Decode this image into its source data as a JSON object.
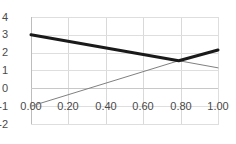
{
  "chart_data": {
    "type": "line",
    "title": "",
    "xlabel": "",
    "ylabel": "",
    "xlim": [
      0.0,
      1.0
    ],
    "ylim": [
      -2,
      4
    ],
    "grid": true,
    "legend": "none",
    "xticks": [
      "0.00",
      "0.20",
      "0.40",
      "0.60",
      "0.80",
      "1.00"
    ],
    "xtick_values": [
      0.0,
      0.2,
      0.4,
      0.6,
      0.8,
      1.0
    ],
    "yticks": [
      "4",
      "3",
      "2",
      "1",
      "0",
      "-1",
      "-2"
    ],
    "ytick_values": [
      4,
      3,
      2,
      1,
      0,
      -1,
      -2
    ],
    "series": [
      {
        "name": "thick-descending-then-rising",
        "color": "#1a1a1a",
        "width": 3,
        "x": [
          0.0,
          0.79,
          1.0
        ],
        "values": [
          3.0,
          1.55,
          2.15
        ]
      },
      {
        "name": "thin-rising-then-falling",
        "color": "#808080",
        "width": 1,
        "x": [
          0.0,
          0.79,
          1.0
        ],
        "values": [
          -1.0,
          1.55,
          1.15
        ]
      }
    ],
    "intersection": {
      "x": 0.79,
      "y": 1.55
    }
  },
  "axes": {
    "x_tick_labels": [
      "0.00",
      "0.20",
      "0.40",
      "0.60",
      "0.80",
      "1.00"
    ],
    "y_tick_labels": [
      "4",
      "3",
      "2",
      "1",
      "0",
      "-1",
      "-2"
    ]
  },
  "colors": {
    "background": "#ffffff",
    "grid": "#d9d9d9",
    "axis": "#bdbdbd",
    "tick_text": "#4a4a4a",
    "series_primary": "#1a1a1a",
    "series_secondary": "#808080"
  }
}
